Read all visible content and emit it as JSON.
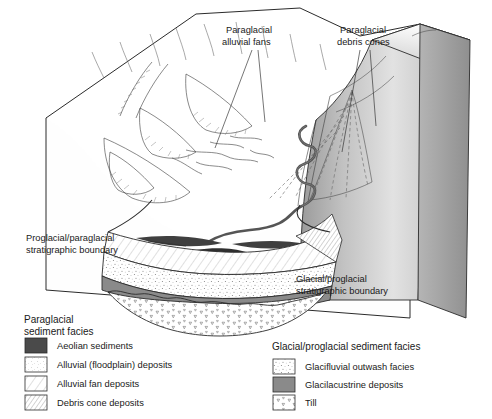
{
  "figure": {
    "type": "geological-block-diagram",
    "annotations": [
      {
        "id": "alluvial-fans",
        "line1": "Paraglacial",
        "line2": "alluvial fans"
      },
      {
        "id": "debris-cones",
        "line1": "Paraglacial",
        "line2": "debris cones"
      },
      {
        "id": "proglacial-boundary",
        "line1": "Proglacial/paraglacial",
        "line2": "stratigraphic boundary"
      },
      {
        "id": "glacial-boundary",
        "line1": "Glacial/proglacial",
        "line2": "stratigraphic boundary"
      }
    ]
  },
  "legend_left": {
    "title_line1": "Paraglacial",
    "title_line2": "sediment facies",
    "items": [
      {
        "label": "Aeolian sediments",
        "swatch": "solid-dark",
        "color": "#4a4a4a"
      },
      {
        "label": "Alluvial (floodplain) deposits",
        "swatch": "fine-stipple",
        "color": "#ffffff"
      },
      {
        "label": "Alluvial fan deposits",
        "swatch": "diagonal-sparse",
        "color": "#ffffff"
      },
      {
        "label": "Debris cone deposits",
        "swatch": "diagonal-dense",
        "color": "#ffffff"
      }
    ]
  },
  "legend_right": {
    "title": "Glacial/proglacial sediment facies",
    "items": [
      {
        "label": "Glacifluvial outwash facies",
        "swatch": "coarse-stipple",
        "color": "#ffffff"
      },
      {
        "label": "Glacilacustrine deposits",
        "swatch": "solid-gray",
        "color": "#8a8a8a"
      },
      {
        "label": "Till",
        "swatch": "triangles",
        "color": "#ffffff"
      }
    ]
  },
  "palette": {
    "block_front": "#d9d9d9",
    "block_side": "#a8a8a8",
    "lacustrine": "#8a8a8a",
    "aeolian": "#4a4a4a",
    "ink": "#2b2b2b"
  }
}
